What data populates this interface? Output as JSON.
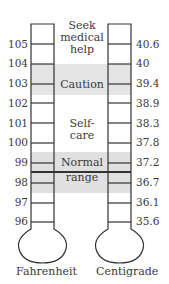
{
  "fahrenheit": {
    "caption": "Fahrenheit",
    "ticks": [
      "105",
      "104",
      "103",
      "102",
      "101",
      "100",
      "99",
      "98",
      "97",
      "96"
    ]
  },
  "centigrade": {
    "caption": "Centigrade",
    "ticks": [
      "40.6",
      "40",
      "39.4",
      "38.9",
      "38.3",
      "37.8",
      "37.2",
      "36.7",
      "36.1",
      "35.6"
    ]
  },
  "zones": {
    "seek": {
      "line1": "Seek",
      "line2": "medical",
      "line3": "help"
    },
    "caution": "Caution",
    "selfcare": "Self-care",
    "normal": {
      "line1": "Normal",
      "line2": "range"
    }
  },
  "colors": {
    "band": "#e4e4e4",
    "line": "#333333",
    "text": "#3a3a3a"
  }
}
